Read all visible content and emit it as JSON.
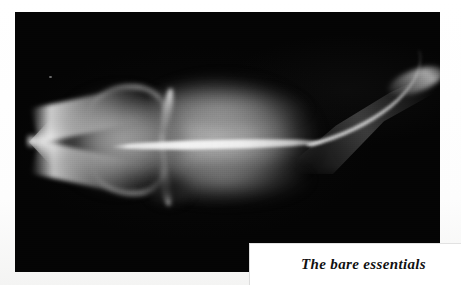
{
  "page": {
    "background_color": "#ffffff",
    "type": "printed-page-scan"
  },
  "plate": {
    "kind": "radiograph-photograph",
    "background_color": "#050505",
    "subject": "fish skeleton x-ray",
    "subject_orientation": "head-left, tail-upper-right",
    "visible_structures": [
      "pointed snout",
      "upper jaw ridge",
      "lower jaw ridge",
      "cranial arches",
      "gill cover strokes",
      "dark organ shadow",
      "vertebral column",
      "tail taper",
      "bright tail tip"
    ]
  },
  "caption": {
    "text": "The bare essentials",
    "style": "italic-serif",
    "text_color": "#111111",
    "box_color": "#ffffff"
  }
}
